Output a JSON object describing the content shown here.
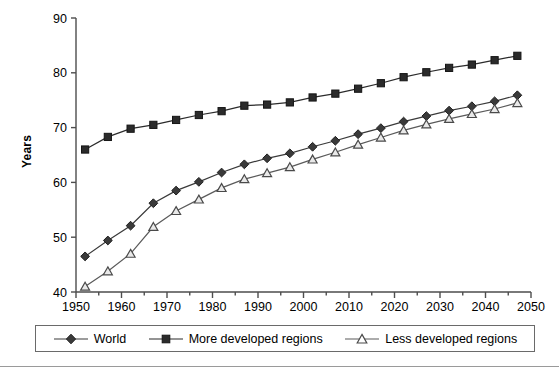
{
  "chart_data": {
    "type": "line",
    "title": "",
    "subtitle": "",
    "xlabel": "",
    "ylabel": "Years",
    "xlim": [
      1950,
      2050
    ],
    "ylim": [
      40,
      90
    ],
    "xticks": [
      1950,
      1960,
      1970,
      1980,
      1990,
      2000,
      2010,
      2020,
      2030,
      2040,
      2050
    ],
    "yticks": [
      40,
      50,
      60,
      70,
      80,
      90
    ],
    "minor_xticks_interval": 5,
    "grid": false,
    "legend_position": "bottom",
    "x": [
      1952,
      1957,
      1962,
      1967,
      1972,
      1977,
      1982,
      1987,
      1992,
      1997,
      2002,
      2007,
      2012,
      2017,
      2022,
      2027,
      2032,
      2037,
      2042,
      2047
    ],
    "series": [
      {
        "name": "World",
        "marker": "diamond",
        "marker_style": "filled",
        "color": "#3a3a3a",
        "values": [
          46.5,
          49.4,
          52.1,
          56.2,
          58.5,
          60.1,
          61.8,
          63.3,
          64.4,
          65.3,
          66.5,
          67.6,
          68.8,
          69.9,
          71.1,
          72.1,
          73.1,
          73.9,
          74.8,
          75.9
        ]
      },
      {
        "name": "More developed regions",
        "marker": "square",
        "marker_style": "filled",
        "color": "#2b2b2b",
        "values": [
          66.0,
          68.3,
          69.8,
          70.5,
          71.4,
          72.3,
          73.0,
          74.0,
          74.2,
          74.6,
          75.5,
          76.2,
          77.1,
          78.1,
          79.2,
          80.1,
          80.9,
          81.5,
          82.3,
          83.1
        ]
      },
      {
        "name": "Less developed regions",
        "marker": "triangle",
        "marker_style": "open",
        "color": "#5a5a5a",
        "values": [
          41.0,
          43.8,
          47.0,
          51.9,
          54.8,
          56.9,
          59.0,
          60.6,
          61.7,
          62.8,
          64.2,
          65.5,
          66.9,
          68.2,
          69.5,
          70.6,
          71.6,
          72.5,
          73.4,
          74.5
        ]
      }
    ]
  },
  "axes": {
    "ylabel": "Years",
    "ytick_labels": [
      "90",
      "80",
      "70",
      "60",
      "50",
      "40"
    ],
    "xtick_labels": [
      "1950",
      "1960",
      "1970",
      "1980",
      "1990",
      "2000",
      "2010",
      "2020",
      "2030",
      "2040",
      "2050"
    ]
  },
  "legend": {
    "items": [
      {
        "label": "World",
        "marker": "diamond"
      },
      {
        "label": "More developed regions",
        "marker": "square"
      },
      {
        "label": "Less developed regions",
        "marker": "triangle"
      }
    ]
  }
}
